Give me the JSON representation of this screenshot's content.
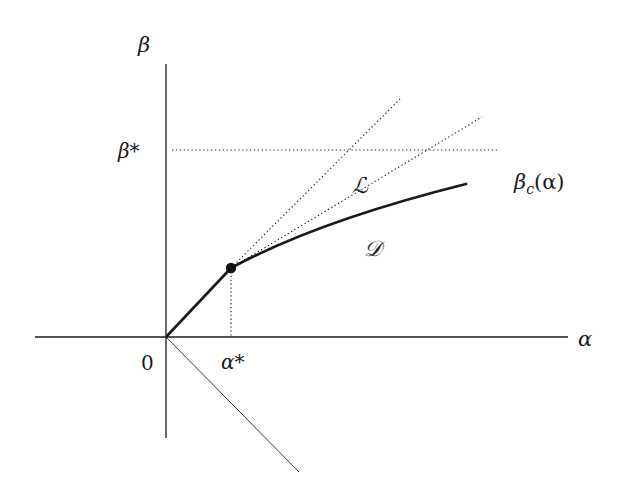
{
  "diagram": {
    "axes": {
      "x_label": "α",
      "y_label": "β",
      "origin_label": "0"
    },
    "marks": {
      "alpha_star": "α*",
      "beta_star": "β*"
    },
    "curves": {
      "critical_curve_label": "βc(α)",
      "critical_curve_base": "β",
      "critical_curve_sub": "c",
      "critical_curve_arg": "(α)"
    },
    "regions": {
      "L_label": "ℒ",
      "D_label": "𝒟"
    },
    "colors": {
      "ink": "#1a1a1a",
      "background": "#ffffff"
    }
  }
}
